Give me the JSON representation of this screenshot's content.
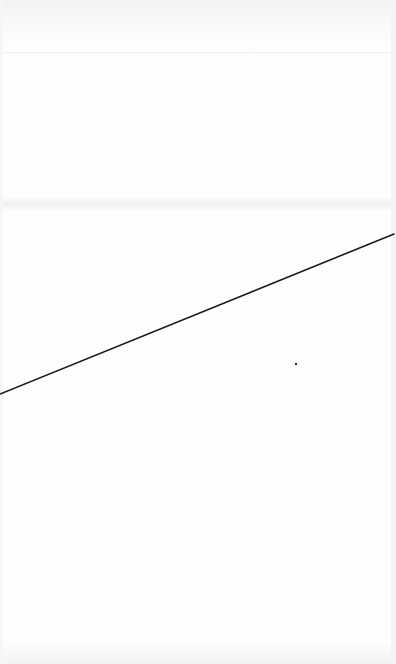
{
  "canvas": {
    "width": 396,
    "height": 664,
    "background": "#ffffff"
  },
  "bands": {
    "top": {
      "y": 0,
      "height": 52,
      "color": "#f3f3f3"
    },
    "middle": {
      "y": 198,
      "height": 12,
      "color": "#efefef"
    },
    "bottom": {
      "y": 640,
      "height": 24,
      "color": "#f3f3f3"
    }
  },
  "line": {
    "x1": 0,
    "y1": 394,
    "x2": 394,
    "y2": 234,
    "color": "#1a1a1a",
    "width": 1.6
  },
  "dot": {
    "cx": 296,
    "cy": 364,
    "r": 1.2,
    "color": "#333333"
  }
}
